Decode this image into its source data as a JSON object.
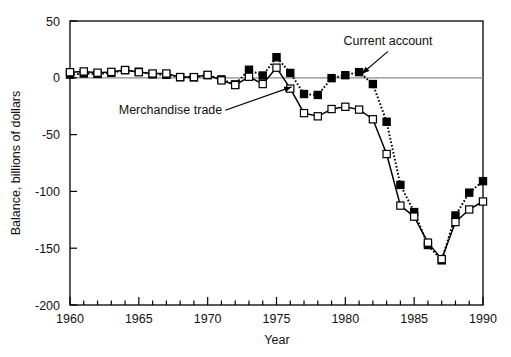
{
  "chart_data": {
    "type": "line",
    "title": "",
    "subtitle": "",
    "xlabel": "Year",
    "ylabel": "Balance, billions of dollars",
    "xlim": [
      1960,
      1990
    ],
    "ylim": [
      -200,
      50
    ],
    "grid": false,
    "zero_line": true,
    "legend_position": "inline-annotations",
    "xticks_major": [
      1960,
      1965,
      1970,
      1975,
      1980,
      1985,
      1990
    ],
    "xticks_minor_step": 1,
    "yticks": [
      50,
      0,
      -50,
      -100,
      -150,
      -200
    ],
    "ytick_labels": [
      "50",
      "0",
      "-50",
      "-100",
      "-150",
      "-200"
    ],
    "xtick_labels": [
      "1960",
      "1965",
      "1970",
      "1975",
      "1980",
      "1985",
      "1990"
    ],
    "x": [
      1960,
      1961,
      1962,
      1963,
      1964,
      1965,
      1966,
      1967,
      1968,
      1969,
      1970,
      1971,
      1972,
      1973,
      1974,
      1975,
      1976,
      1977,
      1978,
      1979,
      1980,
      1981,
      1982,
      1983,
      1984,
      1985,
      1986,
      1987,
      1988,
      1989,
      1990
    ],
    "series": [
      {
        "name": "Current account",
        "marker": "filled-square",
        "line_style": "dotted",
        "color": "#000000",
        "values": [
          2.8,
          3.8,
          3.4,
          4.4,
          6.8,
          5.4,
          3.0,
          2.6,
          0.6,
          0.4,
          2.3,
          -1.4,
          -5.8,
          7.1,
          2.0,
          18.1,
          4.3,
          -14.3,
          -15.1,
          -0.3,
          2.3,
          5.0,
          -5.5,
          -38.7,
          -94.3,
          -118.2,
          -147.2,
          -160.7,
          -121.2,
          -101.1,
          -91.0
        ]
      },
      {
        "name": "Merchandise trade",
        "marker": "open-square",
        "line_style": "solid",
        "color": "#000000",
        "values": [
          4.9,
          5.6,
          4.5,
          5.2,
          6.8,
          4.9,
          3.8,
          3.8,
          0.6,
          0.6,
          2.6,
          -2.3,
          -6.4,
          0.9,
          -5.5,
          8.9,
          -9.5,
          -31.1,
          -33.9,
          -27.5,
          -25.5,
          -28.0,
          -36.5,
          -67.1,
          -112.5,
          -122.2,
          -145.1,
          -159.6,
          -127.0,
          -115.9,
          -108.9
        ]
      }
    ],
    "annotations": [
      {
        "text": "Current account",
        "x": 1983.1,
        "y": 28.5,
        "arrow_to_x": 1981.2,
        "arrow_to_y": 3.6
      },
      {
        "text": "Merchandise trade",
        "x": 1967.3,
        "y": -31.5,
        "arrow_to_x": 1976.1,
        "arrow_to_y": -8.0
      }
    ]
  }
}
